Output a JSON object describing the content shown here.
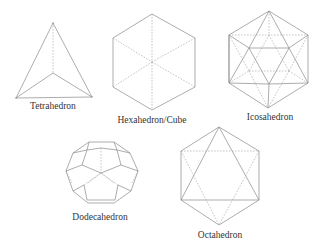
{
  "figure": {
    "background": "#ffffff",
    "line_color": "#8a8a8a",
    "hidden_line_color": "#a0a0a0",
    "label_color": "#333333"
  },
  "solids": [
    {
      "id": "tetrahedron",
      "label": "Tetrahedron",
      "label_pos": [
        53,
        102
      ]
    },
    {
      "id": "hexahedron",
      "label": "Hexahedron/Cube",
      "label_pos": [
        152,
        116
      ]
    },
    {
      "id": "icosahedron",
      "label": "Icosahedron",
      "label_pos": [
        270,
        113
      ]
    },
    {
      "id": "dodecahedron",
      "label": "Dodecahedron",
      "label_pos": [
        100,
        213
      ]
    },
    {
      "id": "octahedron",
      "label": "Octahedron",
      "label_pos": [
        220,
        231
      ]
    }
  ]
}
